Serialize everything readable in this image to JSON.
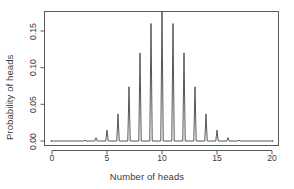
{
  "chart_data": {
    "type": "line",
    "title": "",
    "subtitle": "",
    "xlabel": "Number of heads",
    "ylabel": "Probability of heads",
    "xlim": [
      0,
      20
    ],
    "ylim": [
      0.0,
      0.1762
    ],
    "grid": false,
    "legend": null,
    "xticks": [
      0,
      5,
      10,
      15,
      20
    ],
    "xtick_labels": [
      "0",
      "5",
      "10",
      "15",
      "20"
    ],
    "yticks": [
      0.0,
      0.05,
      0.1,
      0.15
    ],
    "ytick_labels": [
      "0.00",
      "0.05",
      "0.10",
      "0.15"
    ],
    "x": [
      0,
      1,
      2,
      3,
      4,
      5,
      6,
      7,
      8,
      9,
      10,
      11,
      12,
      13,
      14,
      15,
      16,
      17,
      18,
      19,
      20
    ],
    "values": [
      1e-06,
      1.9e-05,
      0.000181,
      0.001087,
      0.004621,
      0.014786,
      0.036972,
      0.073944,
      0.120134,
      0.160179,
      0.176197,
      0.160179,
      0.120134,
      0.073944,
      0.036972,
      0.014786,
      0.004621,
      0.001087,
      0.000181,
      1.9e-05,
      1e-06
    ],
    "series": [
      {
        "name": "P(X = k), n = 20, p = 0.5",
        "values": [
          1e-06,
          1.9e-05,
          0.000181,
          0.001087,
          0.004621,
          0.014786,
          0.036972,
          0.073944,
          0.120134,
          0.160179,
          0.176197,
          0.160179,
          0.120134,
          0.073944,
          0.036972,
          0.014786,
          0.004621,
          0.001087,
          0.000181,
          1.9e-05,
          1e-06
        ]
      }
    ],
    "line_color": "#444444",
    "axis_color": "#555555",
    "background": "#ffffff"
  },
  "axes": {
    "x_axis_title": "Number of heads",
    "y_axis_title": "Probability of heads"
  }
}
